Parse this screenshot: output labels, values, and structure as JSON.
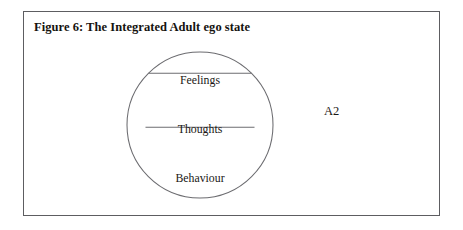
{
  "figure": {
    "caption": "Figure 6: The Integrated Adult ego state",
    "diagram": {
      "type": "segmented-circle",
      "segments": [
        {
          "label": "Feelings"
        },
        {
          "label": "Thoughts"
        },
        {
          "label": "Behaviour"
        }
      ],
      "annotation": "A2"
    },
    "colors": {
      "frame_border": "#5d5d61",
      "circle_stroke": "#6c6c70",
      "text": "#1a1814",
      "caption_text": "#15130f",
      "background": "#ffffff"
    }
  }
}
